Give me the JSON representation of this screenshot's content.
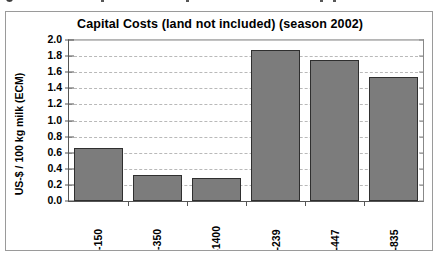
{
  "chart_data": {
    "type": "bar",
    "title": "Capital Costs (land not included) (season 2002)",
    "xlabel": "",
    "ylabel": "US-$ / 100 kg milk (ECM)",
    "categories": [
      "AR-150",
      "AR-350",
      "AR-1400",
      "NZ-239",
      "NZ-447",
      "NZ-835"
    ],
    "values": [
      0.66,
      0.32,
      0.29,
      1.88,
      1.75,
      1.54
    ],
    "ylim": [
      0.0,
      2.0
    ],
    "ytick_labels": [
      "2.0",
      "1.8",
      "1.6",
      "1.4",
      "1.2",
      "1.0",
      "0.8",
      "0.6",
      "0.4",
      "0.2",
      "0.0"
    ],
    "ytick_values": [
      2.0,
      1.8,
      1.6,
      1.4,
      1.2,
      1.0,
      0.8,
      0.6,
      0.4,
      0.2,
      0.0
    ],
    "grid": true,
    "grid_style": "dashed-horizontal",
    "legend": null,
    "legend_position": "none",
    "series": [
      {
        "name": "Capital Costs",
        "values": [
          0.66,
          0.32,
          0.29,
          1.88,
          1.75,
          1.54
        ],
        "color": "#7c7c7c"
      }
    ]
  },
  "colors": {
    "bar_fill": "#7c7c7c",
    "bar_border": "#2f2f2f",
    "gridline": "#b9b9b9",
    "axis": "#555555",
    "frame": "#9a9a9a",
    "background": "#ffffff"
  }
}
